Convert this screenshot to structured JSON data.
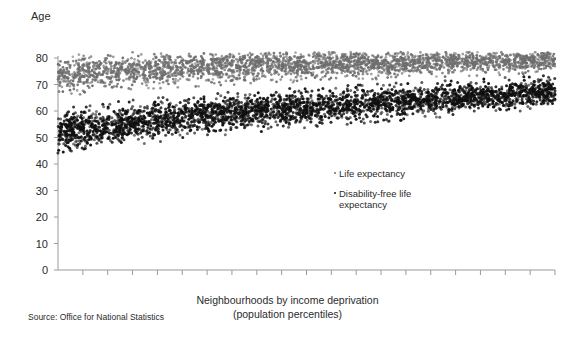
{
  "chart_data": {
    "type": "scatter",
    "title": "",
    "ylabel": "Age",
    "xlabel": "Neighbourhoods by income deprivation (population percentiles)",
    "xlabel_line1": "Neighbourhoods by income deprivation",
    "xlabel_line2": "(population percentiles)",
    "source": "Source: Office for National Statistics",
    "ylim": [
      0,
      80
    ],
    "yticks": [
      0,
      10,
      20,
      30,
      40,
      50,
      60,
      70,
      80
    ],
    "ytick_labels": [
      "0",
      "10",
      "20",
      "30",
      "40",
      "50",
      "60",
      "70",
      "80"
    ],
    "xlim": [
      0,
      100
    ],
    "xticks_count": 20,
    "xtick_labels": [],
    "grid": false,
    "legend_position": "inside-center-right",
    "colors": {
      "life_expectancy": "#6e6e6e",
      "disability_free": "#101010",
      "axis": "#9a9a9a",
      "text": "#2b2b2b",
      "background": "#ffffff"
    },
    "series": [
      {
        "name": "Life expectancy",
        "color": "#6e6e6e",
        "point_count": 2800,
        "marker_size": 1.35,
        "trend": {
          "start_value": 72.6,
          "end_value": 79.2,
          "curve": "rising-concave",
          "spread_start": 3.0,
          "spread_end": 1.9
        },
        "sample_values": [
          {
            "x": 0,
            "y": 72.6
          },
          {
            "x": 5,
            "y": 74.1
          },
          {
            "x": 10,
            "y": 74.9
          },
          {
            "x": 15,
            "y": 75.4
          },
          {
            "x": 20,
            "y": 75.8
          },
          {
            "x": 25,
            "y": 76.1
          },
          {
            "x": 30,
            "y": 76.4
          },
          {
            "x": 35,
            "y": 76.7
          },
          {
            "x": 40,
            "y": 76.9
          },
          {
            "x": 45,
            "y": 77.2
          },
          {
            "x": 50,
            "y": 77.4
          },
          {
            "x": 55,
            "y": 77.6
          },
          {
            "x": 60,
            "y": 77.8
          },
          {
            "x": 65,
            "y": 78.0
          },
          {
            "x": 70,
            "y": 78.2
          },
          {
            "x": 75,
            "y": 78.4
          },
          {
            "x": 80,
            "y": 78.6
          },
          {
            "x": 85,
            "y": 78.8
          },
          {
            "x": 90,
            "y": 78.9
          },
          {
            "x": 95,
            "y": 79.1
          },
          {
            "x": 100,
            "y": 79.2
          }
        ]
      },
      {
        "name": "Disability-free life expectancy",
        "legend_line1": "Disability-free life",
        "legend_line2": "expectancy",
        "color": "#101010",
        "point_count": 3200,
        "marker_size": 1.5,
        "trend": {
          "start_value": 51.8,
          "end_value": 67.2,
          "curve": "rising-linear",
          "spread_start": 3.4,
          "spread_end": 2.4
        },
        "sample_values": [
          {
            "x": 0,
            "y": 51.8
          },
          {
            "x": 5,
            "y": 53.4
          },
          {
            "x": 10,
            "y": 54.6
          },
          {
            "x": 15,
            "y": 55.7
          },
          {
            "x": 20,
            "y": 56.7
          },
          {
            "x": 25,
            "y": 57.6
          },
          {
            "x": 30,
            "y": 58.4
          },
          {
            "x": 35,
            "y": 59.2
          },
          {
            "x": 40,
            "y": 59.9
          },
          {
            "x": 45,
            "y": 60.6
          },
          {
            "x": 50,
            "y": 61.3
          },
          {
            "x": 55,
            "y": 61.9
          },
          {
            "x": 60,
            "y": 62.5
          },
          {
            "x": 65,
            "y": 63.1
          },
          {
            "x": 70,
            "y": 63.7
          },
          {
            "x": 75,
            "y": 64.3
          },
          {
            "x": 80,
            "y": 64.9
          },
          {
            "x": 85,
            "y": 65.5
          },
          {
            "x": 90,
            "y": 66.1
          },
          {
            "x": 95,
            "y": 66.7
          },
          {
            "x": 100,
            "y": 67.2
          }
        ]
      }
    ]
  },
  "legend": {
    "items": [
      {
        "label": "Life expectancy"
      },
      {
        "label": "Disability-free life\nexpectancy"
      }
    ]
  }
}
